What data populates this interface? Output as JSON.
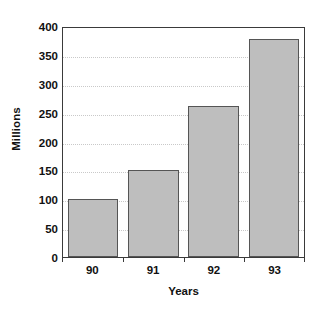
{
  "chart_data": {
    "type": "bar",
    "title": "",
    "subtitle": "",
    "categories": [
      "90",
      "91",
      "92",
      "93"
    ],
    "values": [
      100,
      151,
      262,
      377
    ],
    "series": [
      {
        "name": "Millions",
        "values": [
          100,
          151,
          262,
          377
        ]
      }
    ],
    "xlabel": "Years",
    "ylabel": "Millions",
    "ylim": [
      0,
      400
    ],
    "ytick_values": [
      0,
      50,
      100,
      150,
      200,
      250,
      300,
      350,
      400
    ],
    "ytick_labels": [
      "0",
      "50",
      "100",
      "150",
      "200",
      "250",
      "300",
      "350",
      "400"
    ],
    "grid": true,
    "grid_axis": "y",
    "grid_style": "dotted",
    "legend": false,
    "legend_position": "none",
    "annotations": [],
    "colors": {
      "bar_fill": "#bebebe",
      "bar_border": "#555555",
      "axis": "#3a3a3a",
      "gridline": "#c9c9c9",
      "text": "#111111",
      "background": "#ffffff"
    }
  }
}
